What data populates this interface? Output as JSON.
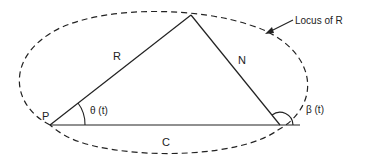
{
  "diagram": {
    "colors": {
      "stroke": "#222222",
      "background": "#ffffff"
    },
    "points": {
      "P": {
        "label": "P"
      },
      "apex": {
        "label": ""
      },
      "right_vertex": {
        "label": ""
      }
    },
    "edges": {
      "R": {
        "label": "R"
      },
      "N": {
        "label": "N"
      },
      "C": {
        "label": "C"
      }
    },
    "angles": {
      "theta": {
        "label": "θ (t)"
      },
      "beta": {
        "label": "β (t)"
      }
    },
    "locus": {
      "label": "Locus of R",
      "style": "dashed ellipse"
    }
  }
}
